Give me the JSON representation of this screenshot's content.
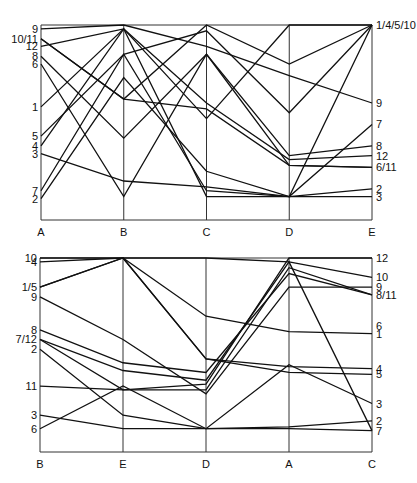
{
  "chart_data": [
    {
      "type": "parallel_coordinates",
      "title": "",
      "axes": [
        "A",
        "B",
        "C",
        "D",
        "E"
      ],
      "left_labels": [
        {
          "text": "9",
          "y": 0.98
        },
        {
          "text": "10/11",
          "y": 0.93
        },
        {
          "text": "12",
          "y": 0.89
        },
        {
          "text": "8",
          "y": 0.84
        },
        {
          "text": "6",
          "y": 0.8
        },
        {
          "text": "1",
          "y": 0.58
        },
        {
          "text": "5",
          "y": 0.43
        },
        {
          "text": "4",
          "y": 0.38
        },
        {
          "text": "3",
          "y": 0.34
        },
        {
          "text": "7",
          "y": 0.15
        },
        {
          "text": "2",
          "y": 0.11
        }
      ],
      "right_labels": [
        {
          "text": "1/4/5/10",
          "y": 1.0
        },
        {
          "text": "9",
          "y": 0.6
        },
        {
          "text": "7",
          "y": 0.49
        },
        {
          "text": "8",
          "y": 0.38
        },
        {
          "text": "12",
          "y": 0.33
        },
        {
          "text": "6/11",
          "y": 0.27
        },
        {
          "text": "2",
          "y": 0.16
        },
        {
          "text": "3",
          "y": 0.12
        }
      ],
      "series": [
        {
          "name": "1",
          "values": [
            0.58,
            0.98,
            0.52,
            1.0,
            1.0
          ]
        },
        {
          "name": "2",
          "values": [
            0.11,
            0.73,
            0.25,
            0.12,
            0.16
          ]
        },
        {
          "name": "3",
          "values": [
            0.34,
            0.2,
            0.17,
            0.12,
            0.12
          ]
        },
        {
          "name": "4",
          "values": [
            0.38,
            0.98,
            0.12,
            0.12,
            1.0
          ]
        },
        {
          "name": "5",
          "values": [
            0.43,
            0.85,
            0.97,
            0.55,
            1.0
          ]
        },
        {
          "name": "6",
          "values": [
            0.8,
            0.12,
            0.85,
            0.28,
            0.27
          ]
        },
        {
          "name": "7",
          "values": [
            0.15,
            0.85,
            0.15,
            0.12,
            0.49
          ]
        },
        {
          "name": "8",
          "values": [
            0.84,
            0.42,
            0.85,
            0.33,
            0.38
          ]
        },
        {
          "name": "9",
          "values": [
            0.98,
            1.0,
            0.89,
            0.74,
            0.6
          ]
        },
        {
          "name": "10",
          "values": [
            0.93,
            0.62,
            1.0,
            0.8,
            1.0
          ]
        },
        {
          "name": "11",
          "values": [
            0.93,
            0.62,
            0.57,
            0.28,
            0.27
          ]
        },
        {
          "name": "12",
          "values": [
            0.89,
            0.98,
            0.6,
            0.31,
            0.33
          ]
        }
      ],
      "ylim": [
        0,
        1
      ],
      "grid": false
    },
    {
      "type": "parallel_coordinates",
      "title": "",
      "axes": [
        "B",
        "E",
        "D",
        "A",
        "C"
      ],
      "left_labels": [
        {
          "text": "10",
          "y": 1.0
        },
        {
          "text": "4",
          "y": 0.98
        },
        {
          "text": "1/5",
          "y": 0.85
        },
        {
          "text": "9",
          "y": 0.8
        },
        {
          "text": "8",
          "y": 0.63
        },
        {
          "text": "7/12",
          "y": 0.58
        },
        {
          "text": "2",
          "y": 0.53
        },
        {
          "text": "11",
          "y": 0.34
        },
        {
          "text": "3",
          "y": 0.19
        },
        {
          "text": "6",
          "y": 0.12
        }
      ],
      "right_labels": [
        {
          "text": "12",
          "y": 1.0
        },
        {
          "text": "10",
          "y": 0.9
        },
        {
          "text": "9",
          "y": 0.85
        },
        {
          "text": "8/11",
          "y": 0.81
        },
        {
          "text": "6",
          "y": 0.65
        },
        {
          "text": "1",
          "y": 0.61
        },
        {
          "text": "4",
          "y": 0.43
        },
        {
          "text": "5",
          "y": 0.4
        },
        {
          "text": "3",
          "y": 0.25
        },
        {
          "text": "2",
          "y": 0.16
        },
        {
          "text": "7",
          "y": 0.11
        }
      ],
      "series": [
        {
          "name": "1",
          "values": [
            0.85,
            1.0,
            0.7,
            0.62,
            0.61
          ]
        },
        {
          "name": "2",
          "values": [
            0.53,
            0.19,
            0.12,
            0.13,
            0.16
          ]
        },
        {
          "name": "3",
          "values": [
            0.19,
            0.12,
            0.12,
            0.45,
            0.25
          ]
        },
        {
          "name": "4",
          "values": [
            0.98,
            1.0,
            0.48,
            0.44,
            0.43
          ]
        },
        {
          "name": "5",
          "values": [
            0.85,
            1.0,
            0.48,
            0.41,
            0.4
          ]
        },
        {
          "name": "6",
          "values": [
            0.12,
            0.34,
            0.12,
            0.12,
            0.11
          ]
        },
        {
          "name": "7",
          "values": [
            0.58,
            0.42,
            0.37,
            0.98,
            0.11
          ]
        },
        {
          "name": "8",
          "values": [
            0.63,
            0.46,
            0.41,
            0.92,
            0.81
          ]
        },
        {
          "name": "9",
          "values": [
            0.8,
            0.58,
            0.3,
            0.85,
            0.85
          ]
        },
        {
          "name": "10",
          "values": [
            1.0,
            1.0,
            1.0,
            0.98,
            0.9
          ]
        },
        {
          "name": "11",
          "values": [
            0.34,
            0.32,
            0.32,
            0.95,
            0.81
          ]
        },
        {
          "name": "12",
          "values": [
            0.58,
            0.32,
            0.35,
            1.0,
            1.0
          ]
        }
      ],
      "ylim": [
        0,
        1
      ],
      "grid": false
    }
  ]
}
